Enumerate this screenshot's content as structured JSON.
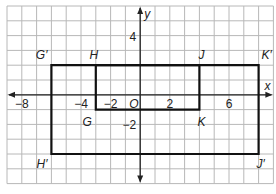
{
  "diagram": {
    "type": "coordinate_grid_dilation",
    "grid": {
      "x_min": -9,
      "x_max": 9,
      "y_min": -6,
      "y_max": 6,
      "step": 1
    },
    "axes": {
      "x_label": "x",
      "y_label": "y",
      "origin_label": "O",
      "x_ticks": [
        {
          "value": -8,
          "label": "−8"
        },
        {
          "value": -4,
          "label": "−4"
        },
        {
          "value": -2,
          "label": "−2"
        },
        {
          "value": 2,
          "label": "2"
        },
        {
          "value": 6,
          "label": "6"
        }
      ],
      "y_ticks": [
        {
          "value": 4,
          "label": "4"
        },
        {
          "value": -2,
          "label": "−2"
        }
      ]
    },
    "rectangles": [
      {
        "name": "GHJK",
        "vertices": [
          {
            "label": "G",
            "x": -3,
            "y": -1
          },
          {
            "label": "H",
            "x": -3,
            "y": 2
          },
          {
            "label": "J",
            "x": 4,
            "y": 2
          },
          {
            "label": "K",
            "x": 4,
            "y": -1
          }
        ]
      },
      {
        "name": "G'H'J'K'",
        "vertices": [
          {
            "label": "G′",
            "x": -6,
            "y": 2
          },
          {
            "label": "H′",
            "x": -6,
            "y": -4
          },
          {
            "label": "J′",
            "x": 8,
            "y": -4
          },
          {
            "label": "K′",
            "x": 8,
            "y": 2
          }
        ]
      }
    ],
    "colors": {
      "grid": "#b8b8b8",
      "axis": "#222222",
      "shape": "#111111",
      "background": "#ffffff"
    }
  }
}
